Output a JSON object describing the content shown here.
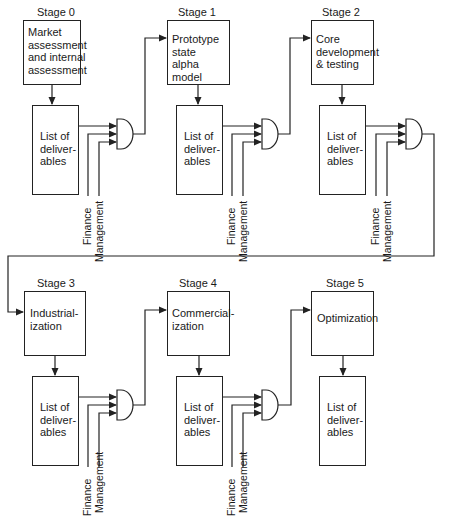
{
  "stages": [
    {
      "label": "Stage 0",
      "task": "Market\nassessment\nand internal\nassessment",
      "deliverables": "List of\ndeliver-\nables",
      "inputs": [
        "Finance",
        "Management"
      ]
    },
    {
      "label": "Stage 1",
      "task": "Prototype\nstate\nalpha model",
      "deliverables": "List of\ndeliver-\nables",
      "inputs": [
        "Finance",
        "Management"
      ]
    },
    {
      "label": "Stage 2",
      "task": "Core\ndevelopment\n& testing",
      "deliverables": "List of\ndeliver-\nables",
      "inputs": [
        "Finance",
        "Management"
      ]
    },
    {
      "label": "Stage 3",
      "task": "Industrial-\nization",
      "deliverables": "List of\ndeliver-\nables",
      "inputs": [
        "Finance",
        "Management"
      ]
    },
    {
      "label": "Stage 4",
      "task": "Commercial-\nization",
      "deliverables": "List of\ndeliver-\nables",
      "inputs": [
        "Finance",
        "Management"
      ]
    },
    {
      "label": "Stage 5",
      "task": "Optimization",
      "deliverables": "List of\ndeliver-\nables",
      "inputs": []
    }
  ],
  "colors": {
    "line": "#222222",
    "background": "#ffffff"
  }
}
